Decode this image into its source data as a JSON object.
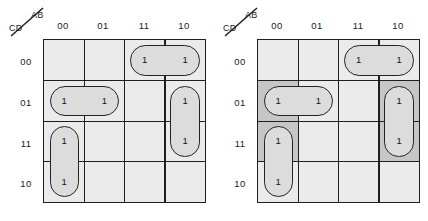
{
  "figure": {
    "type": "karnaugh-map-pair",
    "variables_top": "AB",
    "variables_side": "CD"
  },
  "axis": {
    "top_label": "AB",
    "side_label": "CD",
    "col_headers": [
      "00",
      "01",
      "11",
      "10"
    ],
    "row_headers": [
      "00",
      "01",
      "11",
      "10"
    ]
  },
  "cell_value": "1",
  "colors": {
    "cell_fill": "#ebebeb",
    "group_fill": "#dcdcdc",
    "highlight_fill": "#c6c6c6",
    "line": "#1f1f1f"
  },
  "maps": [
    {
      "name": "kmap-left",
      "ones": [
        {
          "row": 0,
          "col": 2
        },
        {
          "row": 0,
          "col": 3
        },
        {
          "row": 1,
          "col": 0
        },
        {
          "row": 1,
          "col": 1
        },
        {
          "row": 1,
          "col": 3
        },
        {
          "row": 2,
          "col": 0
        },
        {
          "row": 2,
          "col": 3
        },
        {
          "row": 3,
          "col": 0
        }
      ],
      "groups": [
        {
          "name": "group-row00-col11-col10",
          "rows": [
            0,
            0
          ],
          "cols": [
            2,
            3
          ]
        },
        {
          "name": "group-row01-col00-col01",
          "rows": [
            1,
            1
          ],
          "cols": [
            0,
            1
          ]
        },
        {
          "name": "group-row11-row10-col00",
          "rows": [
            2,
            3
          ],
          "cols": [
            0,
            0
          ]
        },
        {
          "name": "group-row01-row11-col10",
          "rows": [
            1,
            2
          ],
          "cols": [
            3,
            3
          ]
        }
      ],
      "highlights": []
    },
    {
      "name": "kmap-right",
      "ones": [
        {
          "row": 0,
          "col": 2
        },
        {
          "row": 0,
          "col": 3
        },
        {
          "row": 1,
          "col": 0
        },
        {
          "row": 1,
          "col": 1
        },
        {
          "row": 1,
          "col": 3
        },
        {
          "row": 2,
          "col": 0
        },
        {
          "row": 2,
          "col": 3
        },
        {
          "row": 3,
          "col": 0
        }
      ],
      "groups": [
        {
          "name": "group-row00-col11-col10",
          "rows": [
            0,
            0
          ],
          "cols": [
            2,
            3
          ]
        },
        {
          "name": "group-row01-col00-col01",
          "rows": [
            1,
            1
          ],
          "cols": [
            0,
            1
          ]
        },
        {
          "name": "group-row11-row10-col00",
          "rows": [
            2,
            3
          ],
          "cols": [
            0,
            0
          ]
        },
        {
          "name": "group-row01-row11-col10",
          "rows": [
            1,
            2
          ],
          "cols": [
            3,
            3
          ]
        }
      ],
      "highlights": [
        {
          "name": "highlight-left-col00-rows01-11",
          "rows": [
            1,
            2
          ],
          "cols": [
            0,
            0
          ]
        },
        {
          "name": "highlight-right-col10-rows01-11",
          "rows": [
            1,
            2
          ],
          "cols": [
            3,
            3
          ]
        }
      ]
    }
  ]
}
